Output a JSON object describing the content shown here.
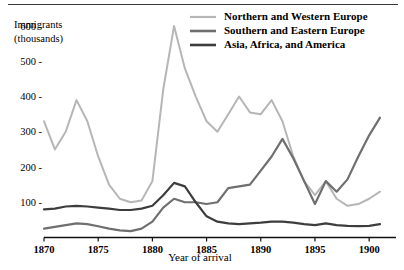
{
  "chart_data": {
    "type": "line",
    "title": "",
    "xlabel": "Year of arrival",
    "ylabel": "Immigrants (thousands)",
    "ylabel_line1": "Immigrants",
    "ylabel_line2": "(thousands)",
    "xlim": [
      1870,
      1901
    ],
    "ylim": [
      0,
      640
    ],
    "grid": false,
    "legend_position": "top-right",
    "yticks": [
      100,
      200,
      300,
      400,
      500,
      600
    ],
    "ytick_labels": [
      "100 -",
      "200 -",
      "300 -",
      "400 -",
      "500 -",
      "600 -"
    ],
    "xticks": [
      1870,
      1875,
      1880,
      1885,
      1890,
      1895,
      1900
    ],
    "xtick_labels": [
      "1870",
      "1875",
      "1880",
      "1885",
      "1890",
      "1895",
      "1900"
    ],
    "x": [
      1870,
      1871,
      1872,
      1873,
      1874,
      1875,
      1876,
      1877,
      1878,
      1879,
      1880,
      1881,
      1882,
      1883,
      1884,
      1885,
      1886,
      1887,
      1888,
      1889,
      1890,
      1891,
      1892,
      1893,
      1894,
      1895,
      1896,
      1897,
      1898,
      1899,
      1900,
      1901
    ],
    "series": [
      {
        "name": "Northern and Western Europe",
        "color": "#b6b6b6",
        "values": [
          330,
          250,
          300,
          390,
          330,
          230,
          150,
          110,
          100,
          105,
          160,
          420,
          600,
          480,
          400,
          330,
          300,
          350,
          400,
          355,
          350,
          390,
          330,
          230,
          160,
          120,
          160,
          110,
          90,
          95,
          110,
          130
        ]
      },
      {
        "name": "Southern and Eastern Europe",
        "color": "#6f6f6f",
        "values": [
          25,
          30,
          35,
          40,
          38,
          32,
          25,
          20,
          18,
          25,
          45,
          85,
          110,
          100,
          100,
          95,
          100,
          140,
          145,
          150,
          190,
          230,
          280,
          225,
          160,
          95,
          160,
          130,
          165,
          230,
          290,
          340
        ]
      },
      {
        "name": "Asia, Africa, and America",
        "color": "#3d3d3d",
        "values": [
          80,
          82,
          88,
          90,
          88,
          85,
          82,
          78,
          78,
          82,
          90,
          120,
          155,
          145,
          100,
          60,
          45,
          40,
          38,
          40,
          42,
          45,
          45,
          42,
          38,
          35,
          40,
          35,
          33,
          32,
          33,
          38
        ]
      }
    ]
  }
}
